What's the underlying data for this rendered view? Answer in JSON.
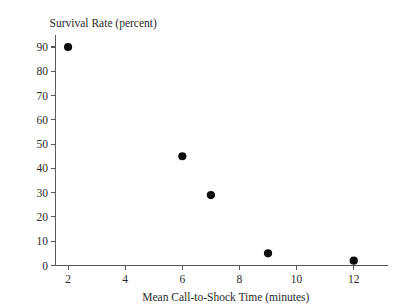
{
  "chart_data": {
    "type": "scatter",
    "title": "",
    "xlabel": "Mean Call-to-Shock Time (minutes)",
    "ylabel": "Survival Rate (percent)",
    "xlim": [
      1.0,
      13.2
    ],
    "ylim": [
      0,
      93
    ],
    "grid": false,
    "legend": "none",
    "x_ticks": [
      2,
      4,
      6,
      8,
      10,
      12
    ],
    "x_tick_labels": [
      "2",
      "4",
      "6",
      "8",
      "10",
      "12"
    ],
    "y_ticks": [
      0,
      10,
      20,
      30,
      40,
      50,
      60,
      70,
      80,
      90
    ],
    "y_tick_labels": [
      "0",
      "10",
      "20",
      "30",
      "40",
      "50",
      "60",
      "70",
      "80",
      "90"
    ],
    "marker": "filled-circle",
    "marker_color": "#0d0d0d",
    "axis_color": "#58585a",
    "background_color": "#ffffff",
    "x": [
      2,
      6,
      7,
      9,
      12
    ],
    "y": [
      90,
      45,
      29,
      5,
      2
    ],
    "points": [
      {
        "x": 2,
        "y": 90
      },
      {
        "x": 6,
        "y": 45
      },
      {
        "x": 7,
        "y": 29
      },
      {
        "x": 9,
        "y": 5
      },
      {
        "x": 12,
        "y": 2
      }
    ]
  }
}
